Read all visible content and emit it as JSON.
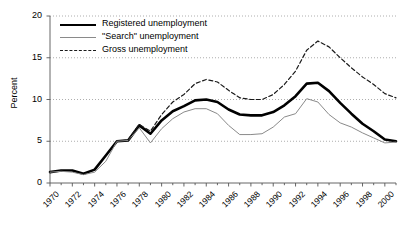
{
  "chart_data": {
    "type": "line",
    "title": "",
    "xlabel": "",
    "ylabel": "Percent",
    "ylim": [
      0,
      20
    ],
    "yticks": [
      0,
      5,
      10,
      15,
      20
    ],
    "xlim": [
      1970,
      2001
    ],
    "xticks": [
      1970,
      1972,
      1974,
      1976,
      1978,
      1980,
      1982,
      1984,
      1986,
      1988,
      1990,
      1992,
      1994,
      1996,
      1998,
      2000
    ],
    "grid": "horizontal-dotted",
    "legend_position": "top-left-inside",
    "x": [
      1970,
      1971,
      1972,
      1973,
      1974,
      1975,
      1976,
      1977,
      1978,
      1979,
      1980,
      1981,
      1982,
      1983,
      1984,
      1985,
      1986,
      1987,
      1988,
      1989,
      1990,
      1991,
      1992,
      1993,
      1994,
      1995,
      1996,
      1997,
      1998,
      1999,
      2000,
      2001
    ],
    "series": [
      {
        "name": "Registered unemployment",
        "style": "solid-thick",
        "color": "#000000",
        "values": [
          1.3,
          1.5,
          1.5,
          1.1,
          1.6,
          3.3,
          5.0,
          5.1,
          6.9,
          5.9,
          7.5,
          8.6,
          9.2,
          9.9,
          10.0,
          9.7,
          8.8,
          8.2,
          8.1,
          8.1,
          8.5,
          9.3,
          10.4,
          11.9,
          12.0,
          11.0,
          9.6,
          8.3,
          7.1,
          6.2,
          5.2,
          5.0
        ]
      },
      {
        "name": "\"Search\" unemployment",
        "style": "solid-thin",
        "color": "#8a8a8a",
        "values": [
          1.3,
          1.4,
          1.3,
          1.0,
          1.3,
          2.6,
          5.0,
          5.1,
          6.6,
          4.8,
          6.5,
          7.7,
          8.5,
          8.9,
          8.9,
          8.3,
          6.9,
          5.8,
          5.8,
          5.9,
          6.7,
          7.9,
          8.3,
          10.1,
          9.7,
          8.2,
          7.2,
          6.7,
          6.0,
          5.4,
          4.8,
          4.9
        ]
      },
      {
        "name": "Gross unemployment",
        "style": "dashed",
        "color": "#1a1a1a",
        "values": [
          null,
          null,
          null,
          null,
          null,
          null,
          null,
          5.2,
          7.0,
          6.2,
          8.2,
          9.7,
          10.6,
          11.9,
          12.4,
          12.1,
          11.1,
          10.2,
          10.0,
          10.0,
          10.6,
          11.8,
          13.4,
          15.9,
          17.0,
          16.3,
          15.0,
          13.8,
          12.7,
          11.8,
          10.7,
          10.2
        ]
      }
    ]
  },
  "axes": {
    "ylabel": "Percent"
  },
  "legend": {
    "items": [
      {
        "label": "Registered unemployment"
      },
      {
        "label": "\"Search\" unemployment"
      },
      {
        "label": "Gross unemployment"
      }
    ]
  }
}
